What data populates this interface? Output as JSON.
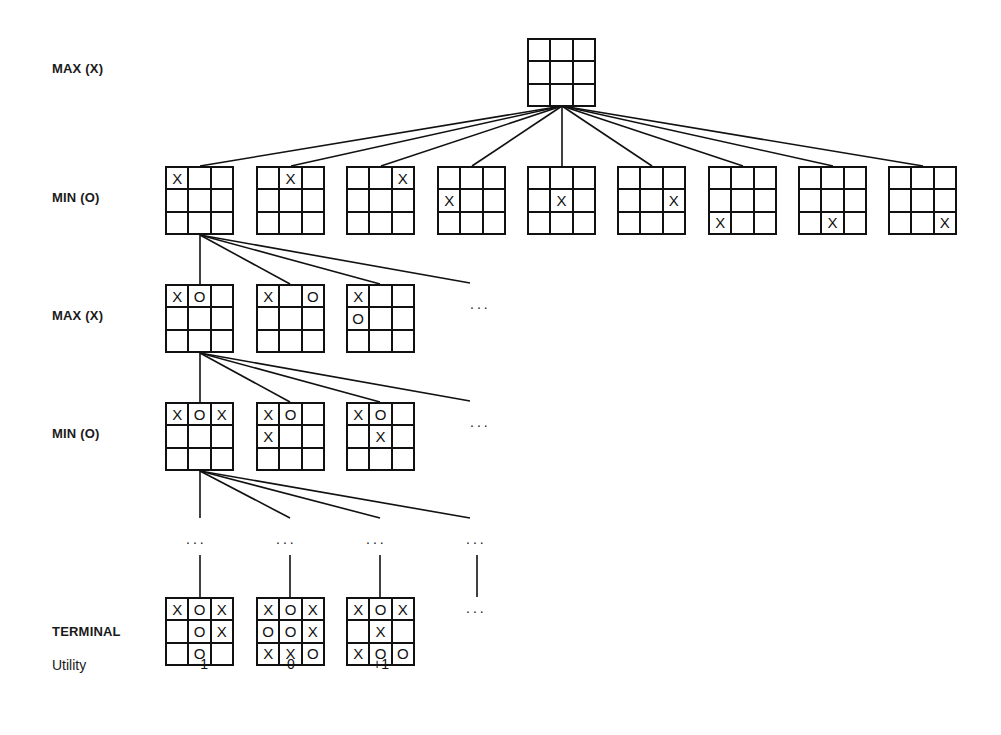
{
  "levels": [
    {
      "label": "MAX (X)",
      "y": 67
    },
    {
      "label": "MIN (O)",
      "y": 196
    },
    {
      "label": "MAX (X)",
      "y": 314
    },
    {
      "label": "MIN (O)",
      "y": 432
    },
    {
      "label": "TERMINAL",
      "y": 624
    },
    {
      "label": "Utility",
      "y": 657
    }
  ],
  "ellipsis": "...",
  "root": {
    "x": 527,
    "y": 38,
    "cells": [
      "",
      "",
      "",
      "",
      "",
      "",
      "",
      "",
      ""
    ]
  },
  "level1": [
    {
      "x": 165,
      "y": 166,
      "cells": [
        "X",
        "",
        "",
        "",
        "",
        "",
        "",
        "",
        ""
      ]
    },
    {
      "x": 256,
      "y": 166,
      "cells": [
        "",
        "X",
        "",
        "",
        "",
        "",
        "",
        "",
        ""
      ]
    },
    {
      "x": 346,
      "y": 166,
      "cells": [
        "",
        "",
        "X",
        "",
        "",
        "",
        "",
        "",
        ""
      ]
    },
    {
      "x": 437,
      "y": 166,
      "cells": [
        "",
        "",
        "",
        "X",
        "",
        "",
        "",
        "",
        ""
      ]
    },
    {
      "x": 527,
      "y": 166,
      "cells": [
        "",
        "",
        "",
        "",
        "X",
        "",
        "",
        "",
        ""
      ]
    },
    {
      "x": 617,
      "y": 166,
      "cells": [
        "",
        "",
        "",
        "",
        "",
        "X",
        "",
        "",
        ""
      ]
    },
    {
      "x": 708,
      "y": 166,
      "cells": [
        "",
        "",
        "",
        "",
        "",
        "",
        "X",
        "",
        ""
      ]
    },
    {
      "x": 798,
      "y": 166,
      "cells": [
        "",
        "",
        "",
        "",
        "",
        "",
        "",
        "X",
        ""
      ]
    },
    {
      "x": 888,
      "y": 166,
      "cells": [
        "",
        "",
        "",
        "",
        "",
        "",
        "",
        "",
        "X"
      ]
    }
  ],
  "level2": [
    {
      "x": 165,
      "y": 284,
      "cells": [
        "X",
        "O",
        "",
        "",
        "",
        "",
        "",
        "",
        ""
      ]
    },
    {
      "x": 256,
      "y": 284,
      "cells": [
        "X",
        "",
        "O",
        "",
        "",
        "",
        "",
        "",
        ""
      ]
    },
    {
      "x": 346,
      "y": 284,
      "cells": [
        "X",
        "",
        "",
        "O",
        "",
        "",
        "",
        "",
        ""
      ]
    }
  ],
  "level3": [
    {
      "x": 165,
      "y": 402,
      "cells": [
        "X",
        "O",
        "X",
        "",
        "",
        "",
        "",
        "",
        ""
      ]
    },
    {
      "x": 256,
      "y": 402,
      "cells": [
        "X",
        "O",
        "",
        "X",
        "",
        "",
        "",
        "",
        ""
      ]
    },
    {
      "x": 346,
      "y": 402,
      "cells": [
        "X",
        "O",
        "",
        "",
        "X",
        "",
        "",
        "",
        ""
      ]
    }
  ],
  "terminal": [
    {
      "x": 165,
      "y": 597,
      "cells": [
        "X",
        "O",
        "X",
        "",
        "O",
        "X",
        "",
        "O",
        ""
      ],
      "utility": "−1"
    },
    {
      "x": 256,
      "y": 597,
      "cells": [
        "X",
        "O",
        "X",
        "O",
        "O",
        "X",
        "X",
        "X",
        "O"
      ],
      "utility": "0"
    },
    {
      "x": 346,
      "y": 597,
      "cells": [
        "X",
        "O",
        "X",
        "",
        "X",
        "",
        "X",
        "O",
        "O"
      ],
      "utility": "+1"
    }
  ],
  "ellipses": [
    {
      "x": 470,
      "y": 296
    },
    {
      "x": 470,
      "y": 414
    },
    {
      "x": 186,
      "y": 531
    },
    {
      "x": 276,
      "y": 531
    },
    {
      "x": 366,
      "y": 531
    },
    {
      "x": 466,
      "y": 531
    },
    {
      "x": 466,
      "y": 600
    }
  ],
  "edges": {
    "root_to_level1": {
      "from": [
        562,
        106
      ],
      "to": [
        [
          200,
          166
        ],
        [
          291,
          166
        ],
        [
          381,
          166
        ],
        [
          472,
          166
        ],
        [
          562,
          166
        ],
        [
          652,
          166
        ],
        [
          743,
          166
        ],
        [
          833,
          166
        ],
        [
          923,
          166
        ]
      ]
    },
    "level1_to_level2": {
      "from": [
        200,
        235
      ],
      "to": [
        [
          200,
          284
        ],
        [
          290,
          284
        ],
        [
          380,
          284
        ],
        [
          470,
          283
        ]
      ]
    },
    "level2_to_level3": {
      "from": [
        200,
        353
      ],
      "to": [
        [
          200,
          402
        ],
        [
          290,
          402
        ],
        [
          380,
          402
        ],
        [
          470,
          401
        ]
      ]
    },
    "level3_to_dots": {
      "from": [
        200,
        471
      ],
      "to": [
        [
          200,
          518
        ],
        [
          290,
          518
        ],
        [
          380,
          518
        ],
        [
          470,
          518
        ]
      ]
    },
    "dots_to_terminal": [
      [
        [
          200,
          555
        ],
        [
          200,
          597
        ]
      ],
      [
        [
          290,
          555
        ],
        [
          290,
          597
        ]
      ],
      [
        [
          380,
          555
        ],
        [
          380,
          597
        ]
      ],
      [
        [
          477,
          555
        ],
        [
          477,
          597
        ]
      ]
    ]
  },
  "colors": {
    "ink": "#111111",
    "background": "#ffffff"
  }
}
